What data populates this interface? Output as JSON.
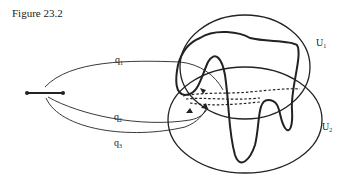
{
  "figure": {
    "title": "Figure 23.2",
    "labels": {
      "q1": {
        "base": "q",
        "sub": "1"
      },
      "q2": {
        "base": "q",
        "sub": "2"
      },
      "q3": {
        "base": "q",
        "sub": "3"
      },
      "U1": {
        "base": "U",
        "sub": "1"
      },
      "U2": {
        "base": "U",
        "sub": "2"
      }
    },
    "colors": {
      "stroke": "#222222",
      "background": "#ffffff"
    }
  }
}
